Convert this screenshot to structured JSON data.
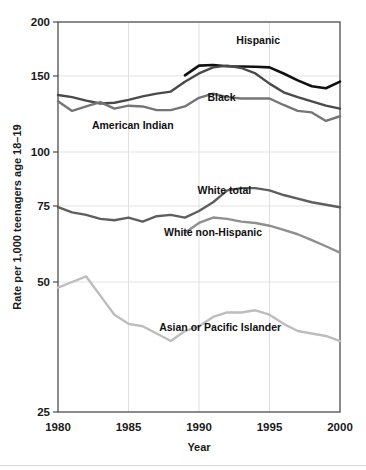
{
  "figure": {
    "background_color": "#ffffff",
    "truncated_top_caption": "Figure 2  Birth rates per 1,000 teenagers age 18-19"
  },
  "chart_data": {
    "type": "line",
    "title": "",
    "subtitle": "",
    "xlabel": "Year",
    "ylabel": "Rate per 1,000 teenagers age 18–19",
    "x": [
      1980,
      1981,
      1982,
      1983,
      1984,
      1985,
      1986,
      1987,
      1988,
      1989,
      1990,
      1991,
      1992,
      1993,
      1994,
      1995,
      1996,
      1997,
      1998,
      1999,
      2000
    ],
    "xlim": [
      1980,
      2000
    ],
    "xticks": [
      1980,
      1985,
      1990,
      1995,
      2000
    ],
    "xticklabels": [
      "1980",
      "1985",
      "1990",
      "1995",
      "2000"
    ],
    "yscale": "log",
    "ylim": [
      25,
      200
    ],
    "yticks": [
      25,
      50,
      75,
      100,
      150,
      200
    ],
    "yticklabels": [
      "25",
      "50",
      "75",
      "100",
      "150",
      "200"
    ],
    "grid": "horizontal-and-vertical-light",
    "legend": "inline-labels",
    "series": [
      {
        "name": "Hispanic",
        "color": "#111111",
        "width": 2.6,
        "label_x": 1994.2,
        "label_anchor": "middle",
        "label_y_value": 178,
        "x": [
          1989,
          1990,
          1991,
          1992,
          1993,
          1994,
          1995,
          1996,
          1997,
          1998,
          1999,
          2000
        ],
        "values": [
          150.5,
          158.5,
          159.0,
          158.0,
          157.8,
          157.5,
          157.0,
          152.0,
          146.5,
          142.0,
          140.5,
          145.5
        ]
      },
      {
        "name": "Black",
        "color": "#4a4a4a",
        "width": 2.4,
        "label_x": 1991.6,
        "label_anchor": "middle",
        "label_y_value": 131,
        "x": [
          1980,
          1981,
          1982,
          1983,
          1984,
          1985,
          1986,
          1987,
          1988,
          1989,
          1990,
          1991,
          1992,
          1993,
          1994,
          1995,
          1996,
          1997,
          1998,
          1999,
          2000
        ],
        "values": [
          135.5,
          134.0,
          131.5,
          129.5,
          130.0,
          132.0,
          134.5,
          136.5,
          138.0,
          145.5,
          152.0,
          157.0,
          158.5,
          156.5,
          152.0,
          144.0,
          137.5,
          134.0,
          131.0,
          128.0,
          126.0
        ]
      },
      {
        "name": "American Indian",
        "color": "#757575",
        "width": 2.4,
        "label_x": 1985.3,
        "label_anchor": "middle",
        "label_y_value": 113,
        "x": [
          1980,
          1981,
          1982,
          1983,
          1984,
          1985,
          1986,
          1987,
          1988,
          1989,
          1990,
          1991,
          1992,
          1993,
          1994,
          1995,
          1996,
          1997,
          1998,
          1999,
          2000
        ],
        "values": [
          131.0,
          124.5,
          127.5,
          130.5,
          126.0,
          128.0,
          127.5,
          125.0,
          125.0,
          127.5,
          133.5,
          136.5,
          134.0,
          133.0,
          133.0,
          133.0,
          128.5,
          124.5,
          123.5,
          118.0,
          121.0
        ]
      },
      {
        "name": "White total",
        "color": "#5e5e5e",
        "width": 2.4,
        "label_x": 1991.8,
        "label_anchor": "middle",
        "label_y_value": 80,
        "x": [
          1980,
          1981,
          1982,
          1983,
          1984,
          1985,
          1986,
          1987,
          1988,
          1989,
          1990,
          1991,
          1992,
          1993,
          1994,
          1995,
          1996,
          1997,
          1998,
          1999,
          2000
        ],
        "values": [
          74.5,
          72.5,
          71.5,
          70.0,
          69.5,
          70.5,
          69.0,
          71.0,
          71.5,
          70.5,
          73.0,
          76.5,
          81.5,
          82.5,
          82.5,
          81.5,
          79.5,
          78.0,
          76.5,
          75.5,
          74.5
        ]
      },
      {
        "name": "White non-Hispanic",
        "color": "#8f8f8f",
        "width": 2.4,
        "label_x": 1991.0,
        "label_anchor": "middle",
        "label_y_value": 64,
        "x": [
          1989,
          1990,
          1991,
          1992,
          1993,
          1994,
          1995,
          1996,
          1997,
          1998,
          1999,
          2000
        ],
        "values": [
          65.0,
          68.5,
          70.5,
          70.0,
          69.0,
          68.5,
          67.5,
          66.0,
          64.5,
          62.5,
          60.5,
          58.5
        ]
      },
      {
        "name": "Asian or Pacific Islander",
        "color": "#bdbdbd",
        "width": 2.4,
        "label_x": 1991.5,
        "label_anchor": "middle",
        "label_y_value": 38.5,
        "x": [
          1980,
          1981,
          1982,
          1983,
          1984,
          1985,
          1986,
          1987,
          1988,
          1989,
          1990,
          1991,
          1992,
          1993,
          1994,
          1995,
          1996,
          1997,
          1998,
          1999,
          2000
        ],
        "values": [
          48.5,
          50.0,
          51.5,
          46.5,
          42.0,
          40.0,
          39.5,
          38.0,
          36.5,
          38.5,
          39.5,
          41.5,
          42.5,
          42.5,
          43.0,
          42.0,
          40.0,
          38.5,
          38.0,
          37.5,
          36.5
        ]
      }
    ]
  }
}
